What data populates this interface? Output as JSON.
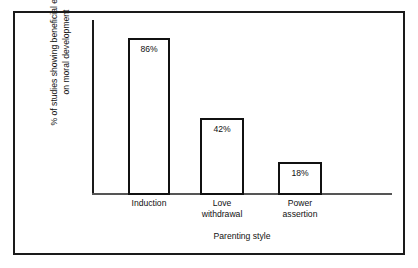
{
  "chart_data": {
    "type": "bar",
    "title": "",
    "subtitle": "",
    "categories": [
      "Induction",
      "Love\nwithdrawal",
      "Power\nassertion"
    ],
    "values": [
      86,
      42,
      18
    ],
    "value_labels": [
      "86%",
      "42%",
      "18%"
    ],
    "xlabel": "Parenting style",
    "ylabel_line1": "% of studies showing beneficial effects",
    "ylabel_line2": "on moral development",
    "ylim": [
      0,
      96
    ],
    "grid": false,
    "legend": "none",
    "y_ticks": [],
    "bar_style": "outlined",
    "value_label_position": "inside-top"
  },
  "style": {
    "background": "#ffffff",
    "frame_color": "#1a1a1a",
    "axis_color": "#555555",
    "bar_outline": "#111111",
    "bar_fill": "#ffffff",
    "text_color": "#111111"
  }
}
